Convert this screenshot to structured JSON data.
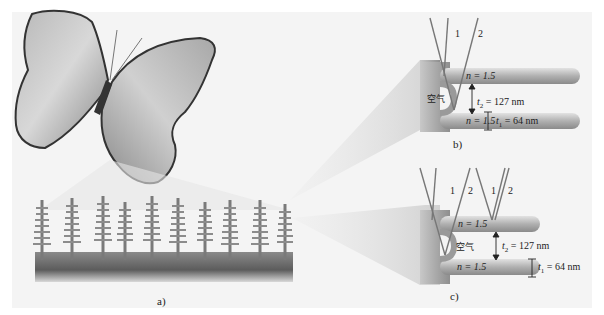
{
  "figure": {
    "panel_a": {
      "label": "a)",
      "description": "Butterfly with magnified wing-scale ridge microstructure (grayscale)"
    },
    "panel_b": {
      "label": "b)",
      "rays": [
        "1",
        "2"
      ],
      "n_top": "n = 1.5",
      "n_bottom": "n = 1.5",
      "gap_medium": "空气",
      "t2": "t",
      "t2_sub": "2",
      "t2_value": " = 127 nm",
      "t1": "t",
      "t1_sub": "1",
      "t1_value": " = 64 nm"
    },
    "panel_c": {
      "label": "c)",
      "rays_left": [
        "1",
        "2"
      ],
      "rays_right": [
        "1",
        "2"
      ],
      "n_top": "n = 1.5",
      "n_bottom": "n = 1.5",
      "gap_medium": "空气",
      "t2": "t",
      "t2_sub": "2",
      "t2_value": " = 127 nm",
      "t1": "t",
      "t1_sub": "1",
      "t1_value": " = 64 nm"
    },
    "colors": {
      "background": "#f4f4f4",
      "structure": "#9a9a9a",
      "structure_dark": "#5a5a5a",
      "ray": "#777777",
      "text": "#222222"
    }
  }
}
